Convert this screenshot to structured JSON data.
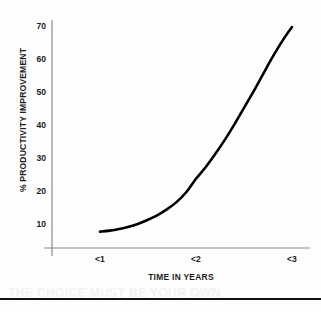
{
  "chart_data": {
    "type": "line",
    "title": "",
    "xlabel": "TIME IN YEARS",
    "ylabel": "% PRODUCTIVITY IMPROVEMENT",
    "grid": false,
    "legend": "none",
    "xlim": [
      0.6,
      3.2
    ],
    "ylim": [
      0,
      75
    ],
    "x_tick_labels": [
      "<1",
      "<2",
      "<3"
    ],
    "x_tick_values": [
      1,
      2,
      3
    ],
    "y_tick_labels": [
      "10",
      "20",
      "30",
      "40",
      "50",
      "60",
      "70"
    ],
    "y_tick_values": [
      10,
      20,
      30,
      40,
      50,
      60,
      70
    ],
    "series": [
      {
        "name": "Productivity improvement",
        "color": "#000000",
        "x": [
          1.0,
          1.1,
          1.2,
          1.3,
          1.4,
          1.5,
          1.6,
          1.7,
          1.8,
          1.9,
          2.0,
          2.1,
          2.2,
          2.3,
          2.4,
          2.5,
          2.6,
          2.7,
          2.8,
          2.9,
          3.0
        ],
        "values": [
          8,
          8.3,
          8.8,
          9.5,
          10.4,
          11.6,
          13.0,
          14.8,
          17.0,
          20.0,
          24.0,
          27.5,
          31.5,
          35.8,
          40.5,
          45.5,
          50.5,
          55.8,
          61.0,
          65.8,
          70.0
        ]
      }
    ],
    "annotations": []
  },
  "axes": {
    "y_ticks": [
      {
        "label": "70",
        "value": 70
      },
      {
        "label": "60",
        "value": 60
      },
      {
        "label": "50",
        "value": 50
      },
      {
        "label": "40",
        "value": 40
      },
      {
        "label": "30",
        "value": 30
      },
      {
        "label": "20",
        "value": 20
      },
      {
        "label": "10",
        "value": 10
      }
    ],
    "x_ticks": [
      {
        "label": "<1",
        "value": 1
      },
      {
        "label": "<2",
        "value": 2
      },
      {
        "label": "<3",
        "value": 3
      }
    ],
    "y_title": "% PRODUCTIVITY IMPROVEMENT",
    "x_title": "TIME IN YEARS",
    "axis_color": "#8c8c8c"
  },
  "footer": {
    "bleed_line_1": "THE CHOICE MUST BE YOUR OWN",
    "bleed_line_2": "",
    "rule_color": "#111111"
  }
}
